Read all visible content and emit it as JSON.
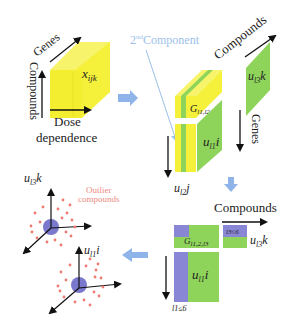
{
  "colors": {
    "yellow": "#f5f03a",
    "yellow_side": "#e8e320",
    "green": "#8fd45a",
    "purple": "#8a86d6",
    "blue_arrow": "#8fb4ea",
    "component_text": "#9cc0ea",
    "outlier_text": "#ee8a80",
    "outlier_dot": "#ee7a70",
    "center_blob": "#7a78cc"
  },
  "tensor": {
    "label": "x",
    "subscript": "ijk",
    "axis_genes": "Genes",
    "axis_compounds": "Compounds",
    "axis_dose_line1": "Dose",
    "axis_dose_line2": "dependence"
  },
  "decomposition": {
    "component_label_sup": "nd",
    "component_label_num": "2",
    "component_label_text": "Component",
    "core_label": "G",
    "core_subscript": "l1,l2,l3",
    "compounds_factor": "u",
    "compounds_factor_sub": "l3",
    "compounds_factor_idx": "k",
    "genes_factor": "u",
    "genes_factor_sub": "l1",
    "genes_factor_idx": "i",
    "dose_factor": "u",
    "dose_factor_sub": "l2",
    "dose_factor_idx": "j",
    "axis_compounds": "Compounds",
    "axis_genes": "Genes"
  },
  "reduced": {
    "axis_compounds": "Compounds",
    "core_label": "G",
    "core_subscript": "l1,2,l3",
    "compounds_limit": "l3≤6",
    "compounds_factor": "u",
    "compounds_factor_sub": "l3",
    "compounds_factor_idx": "k",
    "genes_factor": "u",
    "genes_factor_sub": "l1",
    "genes_factor_idx": "i",
    "genes_limit": "l1≤6"
  },
  "scatter": {
    "top_axis_label": "u",
    "top_axis_sub": "l3",
    "top_axis_idx": "k",
    "outlier_line1": "Outlier",
    "outlier_line2": "compounds",
    "bottom_axis_label": "u",
    "bottom_axis_sub": "l1",
    "bottom_axis_idx": "i"
  }
}
